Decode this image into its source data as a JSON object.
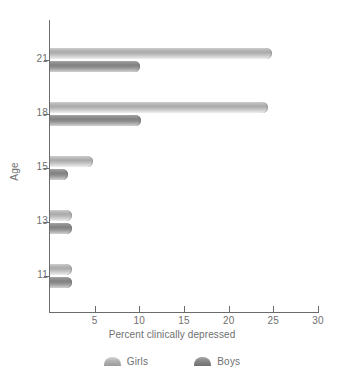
{
  "chart_data": {
    "type": "bar",
    "orientation": "horizontal",
    "title": "",
    "xlabel": "Percent clinically depressed",
    "ylabel": "Age",
    "categories": [
      "11",
      "13",
      "15",
      "18",
      "21"
    ],
    "series": [
      {
        "name": "Girls",
        "color": "#b4b4b4",
        "values": [
          2.5,
          2.5,
          4.8,
          24.4,
          24.9
        ]
      },
      {
        "name": "Boys",
        "color": "#858585",
        "values": [
          2.5,
          2.5,
          2.0,
          10.2,
          10.1
        ]
      }
    ],
    "xlim": [
      0,
      30
    ],
    "xticks": [
      5,
      10,
      15,
      20,
      25,
      30
    ],
    "yticks": [
      "11",
      "13",
      "15",
      "18",
      "21"
    ],
    "grid": false,
    "legend_position": "bottom"
  },
  "axes": {
    "x_title": "Percent clinically depressed",
    "y_title": "Age"
  },
  "legend": {
    "items": [
      {
        "label": "Girls"
      },
      {
        "label": "Boys"
      }
    ]
  }
}
